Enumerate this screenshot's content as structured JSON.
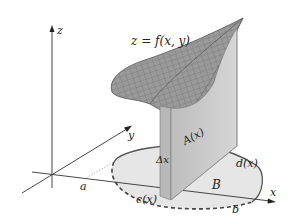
{
  "diagram": {
    "title_equation": "z = f(x, y)",
    "axes": {
      "z_label": "z",
      "y_label": "y",
      "x_label": "x"
    },
    "labels": {
      "a": "a",
      "b": "b",
      "cx": "c(x)",
      "dx": "d(x)",
      "region": "B",
      "cross_section": "A(x)",
      "delta_x": "Δx"
    },
    "colors": {
      "surface": "#8a8a8a",
      "surface_mesh": "#5a5a5a",
      "slab": "#c4c4c4",
      "region_fill": "#e6e6e6",
      "axis": "#333333"
    }
  }
}
